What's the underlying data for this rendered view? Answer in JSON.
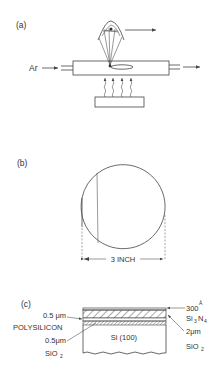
{
  "panel_a": {
    "label": "(a)",
    "gas_label": "Ar"
  },
  "panel_b": {
    "label": "(b)",
    "dimension_label": "3 INCH"
  },
  "panel_c": {
    "label": "(c)",
    "substrate_label": "Si (100)",
    "left_labels": {
      "poly_thickness": "0.5 μm",
      "poly_material": "POLYSILICON",
      "oxide_thickness": "0.5μm",
      "oxide_material": "SiO",
      "oxide_subscript": "2"
    },
    "right_labels": {
      "nitride_thickness": "300",
      "nitride_unit": "Å",
      "nitride_material_a": "Si",
      "nitride_sub_a": "3",
      "nitride_material_b": "N",
      "nitride_sub_b": "4",
      "oxide_thickness": "2μm",
      "oxide_material": "SiO",
      "oxide_subscript": "2"
    }
  }
}
